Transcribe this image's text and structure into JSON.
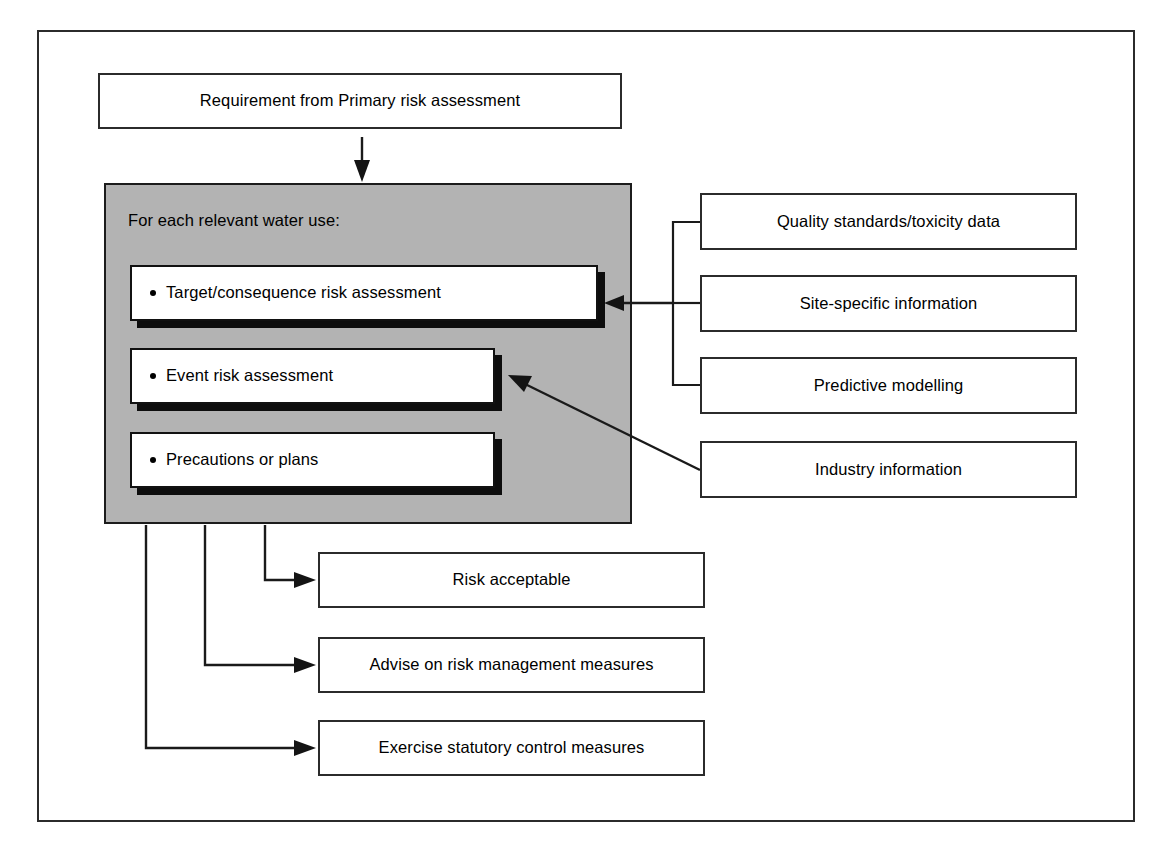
{
  "diagram": {
    "frame": {
      "name": "outer-border"
    },
    "input_box": {
      "label": "Requirement from Primary risk assessment"
    },
    "process_panel": {
      "caption": "For each relevant water use:",
      "fill_color": "#b3b3b3",
      "steps": [
        {
          "label": "Target/consequence risk assessment"
        },
        {
          "label": "Event risk assessment"
        },
        {
          "label": "Precautions or plans"
        }
      ]
    },
    "information_sources": [
      {
        "label": "Quality standards/toxicity data"
      },
      {
        "label": "Site-specific information"
      },
      {
        "label": "Predictive modelling"
      },
      {
        "label": "Industry information"
      }
    ],
    "outcomes": [
      {
        "label": "Risk acceptable"
      },
      {
        "label": "Advise on risk management measures"
      },
      {
        "label": "Exercise statutory control measures"
      }
    ],
    "connectors": [
      {
        "name": "input-to-panel",
        "style": "arrow-down"
      },
      {
        "name": "sources-bracket-to-target",
        "style": "bracket-arrow-left"
      },
      {
        "name": "industry-to-event",
        "style": "diagonal-arrow"
      },
      {
        "name": "panel-to-risk-acceptable",
        "style": "elbow-arrow-right"
      },
      {
        "name": "panel-to-advise",
        "style": "elbow-arrow-right"
      },
      {
        "name": "panel-to-exercise",
        "style": "elbow-arrow-right"
      }
    ]
  }
}
